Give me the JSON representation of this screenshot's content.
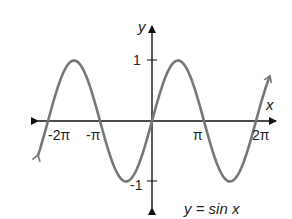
{
  "chart_data": {
    "type": "line",
    "title": "y = sin x",
    "xlabel": "x",
    "ylabel": "y",
    "function": "sin",
    "x_range": [
      -6.9,
      7.1
    ],
    "xlim": [
      -7.3,
      7.3
    ],
    "ylim": [
      -1.5,
      1.7
    ],
    "x_ticks": [
      {
        "value": -6.2832,
        "label": "-2π"
      },
      {
        "value": -3.1416,
        "label": "-π"
      },
      {
        "value": 3.1416,
        "label": "π"
      },
      {
        "value": 6.2832,
        "label": "2π"
      }
    ],
    "y_ticks": [
      {
        "value": 1,
        "label": "1"
      },
      {
        "value": -1,
        "label": "-1"
      }
    ],
    "series": [
      {
        "name": "y = sin x",
        "color": "#777777",
        "x": [
          -6.2832,
          -4.7124,
          -3.1416,
          -1.5708,
          0,
          1.5708,
          3.1416,
          4.7124,
          6.2832
        ],
        "values": [
          0,
          1,
          0,
          -1,
          0,
          1,
          0,
          -1,
          0
        ]
      }
    ],
    "grid": false,
    "legend": "none",
    "annotations": [
      "y = sin x"
    ]
  },
  "labels": {
    "x_axis": "x",
    "y_axis": "y",
    "equation": "y = sin x",
    "tick_neg_2pi": "-2π",
    "tick_neg_pi": "-π",
    "tick_pi": "π",
    "tick_2pi": "2π",
    "tick_y_pos1": "1",
    "tick_y_neg1": "-1"
  },
  "colors": {
    "axis": "#111111",
    "curve": "#777777",
    "text": "#222222"
  }
}
